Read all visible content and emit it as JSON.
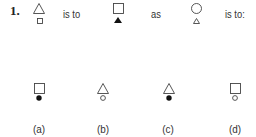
{
  "question": {
    "number": "1.",
    "connector_1": "is to",
    "connector_2": "as",
    "connector_3": "is to:",
    "terms": [
      {
        "top": "triangle-outline",
        "bottom": "square-outline-small"
      },
      {
        "top": "square-outline",
        "bottom": "triangle-filled-small"
      },
      {
        "top": "circle-outline",
        "bottom": "triangle-outline-small"
      }
    ]
  },
  "options": [
    {
      "label": "(a)",
      "top": "square-outline",
      "bottom": "circle-filled-small"
    },
    {
      "label": "(b)",
      "top": "triangle-outline",
      "bottom": "circle-outline-small"
    },
    {
      "label": "(c)",
      "top": "triangle-outline",
      "bottom": "circle-filled-small"
    },
    {
      "label": "(d)",
      "top": "square-outline",
      "bottom": "circle-outline-small"
    }
  ]
}
